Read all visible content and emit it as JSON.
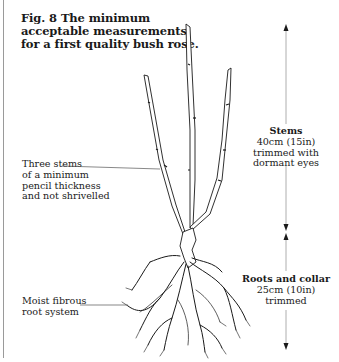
{
  "figure": {
    "title_lines": [
      "Fig. 8  The minimum",
      "acceptable measurements",
      "for a first quality bush rose."
    ]
  },
  "callouts": {
    "stems": [
      "Three stems",
      "of a minimum",
      "pencil thickness",
      "and not shrivelled"
    ],
    "roots": [
      "Moist fibrous",
      "root system"
    ]
  },
  "measurements": {
    "stems": {
      "heading": "Stems",
      "lines": [
        "40cm (15in)",
        "trimmed with",
        "dormant eyes"
      ]
    },
    "roots": {
      "heading": "Roots and collar",
      "lines": [
        "25cm (10in)",
        "trimmed"
      ]
    }
  },
  "colors": {
    "ink": "#1a1a1a",
    "rule": "#9a9a9a",
    "background": "#ffffff"
  }
}
